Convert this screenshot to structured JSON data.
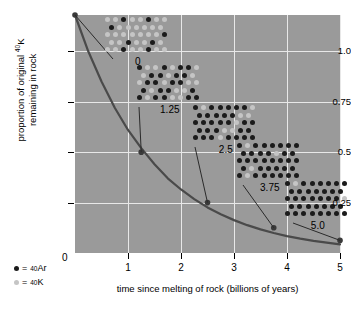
{
  "chart_data": {
    "type": "line",
    "title": "",
    "xlabel": "time since melting of rock (billions of years)",
    "ylabel_line1": "proportion of original ",
    "ylabel_sup": "40",
    "ylabel_line1b": "K",
    "ylabel_line2": "remaining in rock",
    "xlim": [
      0,
      5
    ],
    "ylim": [
      0,
      1.18
    ],
    "xticks": [
      1,
      2,
      3,
      4,
      5
    ],
    "xtick_labels": [
      "1",
      "2",
      "3",
      "4",
      "5"
    ],
    "yticks": [
      1.0,
      0.75,
      0.5,
      0.25
    ],
    "ytick_labels": [
      "1.0",
      "0.75",
      "0.5",
      "0.25"
    ],
    "origin_label": "0",
    "grid": true,
    "legend_position": "bottom-left",
    "half_life": 1.25,
    "curve": {
      "name": "proportion of original 40K remaining",
      "x": [
        0,
        0.25,
        0.5,
        0.75,
        1.0,
        1.25,
        1.5,
        1.75,
        2.0,
        2.25,
        2.5,
        2.75,
        3.0,
        3.25,
        3.5,
        3.75,
        4.0,
        4.25,
        4.5,
        4.75,
        5.0
      ],
      "y": [
        1.18,
        1.0,
        0.85,
        0.72,
        0.61,
        0.52,
        0.44,
        0.37,
        0.315,
        0.267,
        0.226,
        0.192,
        0.163,
        0.138,
        0.117,
        0.099,
        0.084,
        0.071,
        0.06,
        0.051,
        0.043
      ]
    },
    "markers": [
      {
        "x": 0,
        "y": 1.18,
        "label": "0"
      },
      {
        "x": 1.25,
        "y": 0.5,
        "label": "1.25"
      },
      {
        "x": 2.5,
        "y": 0.25,
        "label": "2.5"
      },
      {
        "x": 3.75,
        "y": 0.125,
        "label": "3.75"
      },
      {
        "x": 5.0,
        "y": 0.0625,
        "label": "5.0"
      }
    ],
    "clusters": [
      {
        "label": "0",
        "time": 0,
        "proportion_k": 1.0,
        "total_atoms": 36,
        "ar_atoms": 0,
        "k_atoms": 36,
        "cols": 8,
        "rows": 5
      },
      {
        "label": "1.25",
        "time": 1.25,
        "proportion_k": 0.5,
        "total_atoms": 36,
        "ar_atoms": 18,
        "k_atoms": 18,
        "cols": 8,
        "rows": 5
      },
      {
        "label": "2.5",
        "time": 2.5,
        "proportion_k": 0.25,
        "total_atoms": 36,
        "ar_atoms": 27,
        "k_atoms": 9,
        "cols": 8,
        "rows": 5
      },
      {
        "label": "3.75",
        "time": 3.75,
        "proportion_k": 0.125,
        "total_atoms": 36,
        "ar_atoms": 32,
        "k_atoms": 4,
        "cols": 8,
        "rows": 5
      },
      {
        "label": "5.0",
        "time": 5.0,
        "proportion_k": 0.0625,
        "total_atoms": 36,
        "ar_atoms": 34,
        "k_atoms": 2,
        "cols": 8,
        "rows": 5
      }
    ],
    "legend": [
      {
        "symbol": "ar",
        "eq": "=",
        "isotope_sup": "40",
        "isotope": "Ar"
      },
      {
        "symbol": "k",
        "eq": "=",
        "isotope_sup": "40",
        "isotope": "K"
      }
    ],
    "colors": {
      "plot_background": "#9a9a9a",
      "gridline": "#e8e8e8",
      "curve": "#4a4a4a",
      "ar_atom": "#1b1b1b",
      "k_atom": "#c5c5c5",
      "text": "#000000",
      "page_background": "#ffffff"
    }
  }
}
